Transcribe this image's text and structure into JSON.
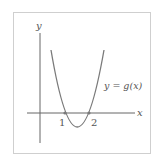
{
  "diagram": {
    "type": "function-graph",
    "axes": {
      "x_label": "x",
      "y_label": "y"
    },
    "curve": {
      "label": "y = g(x)",
      "kind": "upward parabola",
      "roots": [
        1,
        2
      ]
    },
    "ticks": {
      "root1": "1",
      "root2": "2"
    },
    "colors": {
      "background": "#ffffff",
      "frame": "#cfcfcf",
      "axes": "#666666",
      "curve": "#7a7a7a",
      "text": "#555555"
    }
  }
}
